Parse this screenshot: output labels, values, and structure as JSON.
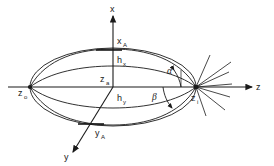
{
  "figure": {
    "type": "technical-line-diagram",
    "background_color": "#ffffff",
    "line_color": "#1a1a1a"
  },
  "axes": {
    "vertical": {
      "label": "x",
      "direction": "up"
    },
    "horizontal": {
      "label": "z",
      "direction": "right"
    },
    "depth": {
      "label": "y",
      "direction": "down-left"
    }
  },
  "vertices": {
    "left": {
      "label": "z",
      "subscript": "o"
    },
    "right": {
      "label": "z",
      "subscript": "i"
    }
  },
  "dimensions": [
    {
      "label": "x",
      "subscript": "A",
      "name": "x-a-dimension"
    },
    {
      "label": "h",
      "subscript": "x",
      "name": "h-x-dimension"
    },
    {
      "label": "z",
      "subscript": "a",
      "name": "z-a-dimension"
    },
    {
      "label": "h",
      "subscript": "y",
      "name": "h-y-dimension"
    },
    {
      "label": "y",
      "subscript": "A",
      "name": "y-a-dimension"
    }
  ],
  "angles": [
    {
      "symbol": "α",
      "position": "above-axis",
      "name": "alpha-angle"
    },
    {
      "symbol": "β",
      "position": "below-axis",
      "name": "beta-angle"
    }
  ]
}
